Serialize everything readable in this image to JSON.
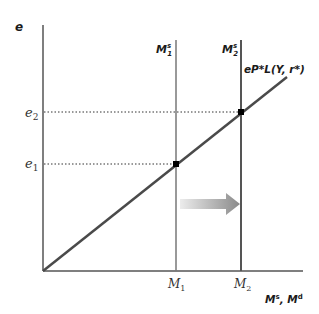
{
  "diagram": {
    "y_axis_label": "e",
    "x_axis_label_main": "M",
    "x_axis_label_s": "s",
    "x_axis_label_sep": ", M",
    "x_axis_label_d": "d",
    "curve_label": "eP*L(Y, r*)",
    "supply_lines": [
      {
        "name": "M",
        "sup": "s",
        "sub": "1",
        "tick": "M",
        "tick_sub": "1"
      },
      {
        "name": "M",
        "sup": "s",
        "sub": "2",
        "tick": "M",
        "tick_sub": "2"
      }
    ],
    "y_ticks": [
      {
        "label": "e",
        "sub": "1"
      },
      {
        "label": "e",
        "sub": "2"
      }
    ],
    "arrow_direction": "right",
    "colors": {
      "axis": "#555555",
      "curve": "#4a4a4a",
      "dot": "#000000",
      "arrow_start": "#e6e6e6",
      "arrow_end": "#888888"
    }
  }
}
